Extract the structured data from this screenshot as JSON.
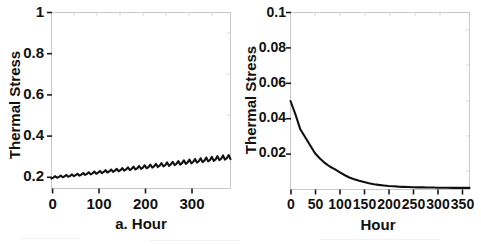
{
  "figure": {
    "background": "#ffffff",
    "line_color": "#111111",
    "frame_color": "#c9c9c9"
  },
  "chart_data": [
    {
      "type": "line",
      "panel_id": "a",
      "title": "",
      "xlabel": "a. Hour",
      "ylabel": "Thermal Stress",
      "xlim": [
        0,
        384
      ],
      "ylim": [
        0,
        1
      ],
      "xticks": [
        0,
        100,
        200,
        300
      ],
      "xtick_labels": [
        "0",
        "100",
        "200",
        "300"
      ],
      "yticks": [
        0.2,
        0.4,
        0.6,
        0.8,
        1
      ],
      "ytick_labels": [
        "0.2",
        "0.4",
        "0.6",
        "0.8",
        "1"
      ],
      "grid": false,
      "legend": "none",
      "description": "Sawtooth oscillation with slowly rising trend from about 0.06 to 0.19",
      "x": [
        0,
        4,
        8,
        12,
        16,
        20,
        24,
        28,
        32,
        36,
        40,
        44,
        48,
        52,
        56,
        60,
        64,
        68,
        72,
        76,
        80,
        84,
        88,
        92,
        96,
        100,
        104,
        108,
        112,
        116,
        120,
        124,
        128,
        132,
        136,
        140,
        144,
        148,
        152,
        156,
        160,
        164,
        168,
        172,
        176,
        180,
        184,
        188,
        192,
        196,
        200,
        204,
        208,
        212,
        216,
        220,
        224,
        228,
        232,
        236,
        240,
        244,
        248,
        252,
        256,
        260,
        264,
        268,
        272,
        276,
        280,
        284,
        288,
        292,
        296,
        300,
        304,
        308,
        312,
        316,
        320,
        324,
        328,
        332,
        336,
        340,
        344,
        348,
        352,
        356,
        360,
        364,
        368,
        372,
        376,
        380,
        384
      ],
      "y": [
        0.057,
        0.062,
        0.07,
        0.061,
        0.066,
        0.073,
        0.064,
        0.069,
        0.077,
        0.067,
        0.072,
        0.08,
        0.07,
        0.076,
        0.084,
        0.073,
        0.079,
        0.088,
        0.077,
        0.083,
        0.092,
        0.08,
        0.086,
        0.096,
        0.084,
        0.09,
        0.1,
        0.087,
        0.094,
        0.104,
        0.091,
        0.097,
        0.108,
        0.094,
        0.101,
        0.112,
        0.098,
        0.104,
        0.116,
        0.101,
        0.108,
        0.12,
        0.105,
        0.112,
        0.124,
        0.108,
        0.115,
        0.128,
        0.112,
        0.119,
        0.132,
        0.115,
        0.122,
        0.136,
        0.119,
        0.126,
        0.14,
        0.122,
        0.13,
        0.144,
        0.126,
        0.133,
        0.148,
        0.129,
        0.137,
        0.152,
        0.133,
        0.14,
        0.156,
        0.136,
        0.144,
        0.16,
        0.14,
        0.148,
        0.164,
        0.143,
        0.151,
        0.168,
        0.147,
        0.155,
        0.172,
        0.15,
        0.158,
        0.176,
        0.154,
        0.162,
        0.18,
        0.157,
        0.165,
        0.184,
        0.161,
        0.169,
        0.188,
        0.164,
        0.172,
        0.19,
        0.167
      ]
    },
    {
      "type": "line",
      "panel_id": "b",
      "title": "",
      "xlabel": "Hour",
      "ylabel": "Thermal Stress",
      "xlim": [
        0,
        365
      ],
      "ylim": [
        0,
        0.1
      ],
      "xticks": [
        0,
        50,
        100,
        150,
        200,
        250,
        300,
        350
      ],
      "xtick_labels": [
        "0",
        "50",
        "100",
        "150",
        "200",
        "250",
        "300",
        "350"
      ],
      "yticks": [
        0.02,
        0.04,
        0.06,
        0.08,
        0.1
      ],
      "ytick_labels": [
        "0.02",
        "0.04",
        "0.06",
        "0.08",
        "0.1"
      ],
      "grid": false,
      "legend": "none",
      "description": "Monotonic exponential decay from 0.050 at hour 0 toward near zero after hour 200",
      "x": [
        0,
        10,
        20,
        30,
        40,
        50,
        60,
        70,
        80,
        90,
        100,
        110,
        120,
        130,
        140,
        150,
        160,
        170,
        180,
        190,
        200,
        210,
        220,
        230,
        240,
        250,
        260,
        270,
        280,
        290,
        300,
        310,
        320,
        330,
        340,
        350,
        360,
        365
      ],
      "y": [
        0.05,
        0.0425,
        0.034,
        0.0295,
        0.025,
        0.0205,
        0.0175,
        0.015,
        0.013,
        0.0115,
        0.0098,
        0.0082,
        0.0068,
        0.0058,
        0.0049,
        0.0042,
        0.0035,
        0.003,
        0.0026,
        0.0023,
        0.002,
        0.0018,
        0.0016,
        0.0015,
        0.0014,
        0.0013,
        0.0012,
        0.0012,
        0.0011,
        0.0011,
        0.001,
        0.001,
        0.001,
        0.0009,
        0.0009,
        0.0009,
        0.0009,
        0.0009
      ]
    }
  ]
}
